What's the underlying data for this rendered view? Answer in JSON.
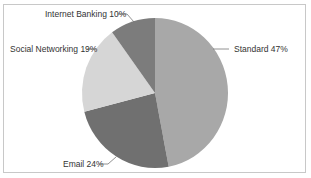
{
  "chart_data": {
    "type": "pie",
    "title": "",
    "categories": [
      "Standard",
      "Email",
      "Social Networking",
      "Internet Banking"
    ],
    "values": [
      47,
      24,
      19,
      10
    ],
    "labels": [
      "Standard 47%",
      "Email 24%",
      "Social Networking 19%",
      "Internet Banking 10%"
    ],
    "colors": [
      "#a8a8a8",
      "#707070",
      "#d6d6d6",
      "#7c7c7c"
    ],
    "start_angle": "top, clockwise",
    "legend": "none (data labels with leader lines)"
  },
  "labels": {
    "standard": "Standard 47%",
    "email": "Email 24%",
    "social": "Social Networking 19%",
    "banking": "Internet Banking 10%"
  }
}
